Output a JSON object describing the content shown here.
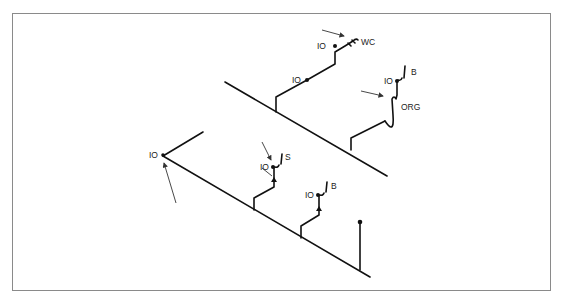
{
  "diagram": {
    "type": "isometric plumbing drain riser diagram",
    "labels": {
      "wc": "WC",
      "org": "ORG",
      "b_upper": "B",
      "s": "S",
      "b_lower": "B",
      "io_top": "IO",
      "io_upper_mid": "IO",
      "io_upper_b": "IO",
      "io_left": "IO",
      "io_s": "IO",
      "io_lower_b": "IO"
    },
    "fixtures": [
      {
        "id": "wc",
        "label": "WC",
        "meaning": "water closet connection"
      },
      {
        "id": "org",
        "label": "ORG",
        "meaning": "trap / overflow relief"
      },
      {
        "id": "b",
        "label": "B",
        "meaning": "bath/basin connection"
      },
      {
        "id": "s",
        "label": "S",
        "meaning": "sink connection"
      }
    ],
    "cleanouts": "IO",
    "colors": {
      "line": "#111111",
      "frame": "#8a8a8a",
      "background": "#ffffff"
    }
  }
}
